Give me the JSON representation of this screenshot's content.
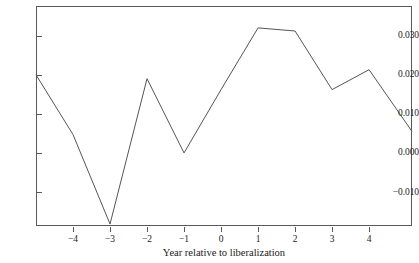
{
  "chart_data": {
    "type": "line",
    "title": "",
    "subtitle": "",
    "xlabel": "Year relative to liberalization",
    "ylabel": "",
    "grid": false,
    "legend": "none",
    "xlim": [
      -5.0,
      5.16
    ],
    "ylim": [
      -0.0187,
      0.0376
    ],
    "xticks": [
      -4,
      -3,
      -2,
      -1,
      0,
      1,
      2,
      3,
      4
    ],
    "xtick_labels": [
      "−4",
      "−3",
      "−2",
      "−1",
      "0",
      "1",
      "2",
      "3",
      "4"
    ],
    "yticks": [
      0.03,
      0.02,
      0.01,
      0.0,
      -0.01
    ],
    "ytick_labels": [
      "0.030",
      "0.020",
      "0.010",
      "0.000",
      "−0.010"
    ],
    "line_color": "#555555",
    "line_width": 1,
    "x": [
      -5.0,
      -4,
      -3,
      -2,
      -1,
      0,
      1,
      2,
      3,
      4,
      5.16
    ],
    "y": [
      0.02,
      0.0047,
      -0.0182,
      0.019,
      0.0,
      0.0162,
      0.032,
      0.0312,
      0.0162,
      0.0213,
      0.0055
    ],
    "series": [
      {
        "name": "effect",
        "x": [
          -5.0,
          -4,
          -3,
          -2,
          -1,
          0,
          1,
          2,
          3,
          4,
          5.16
        ],
        "values": [
          0.02,
          0.0047,
          -0.0182,
          0.019,
          0.0,
          0.0162,
          0.032,
          0.0312,
          0.0162,
          0.0213,
          0.0055
        ]
      }
    ]
  },
  "axes": {
    "x_title": "Year relative to liberalization",
    "y_labels": [
      "0.030",
      "0.020",
      "0.010",
      "0.000",
      "−0.010"
    ],
    "x_labels": [
      "−4",
      "−3",
      "−2",
      "−1",
      "0",
      "1",
      "2",
      "3",
      "4"
    ]
  }
}
